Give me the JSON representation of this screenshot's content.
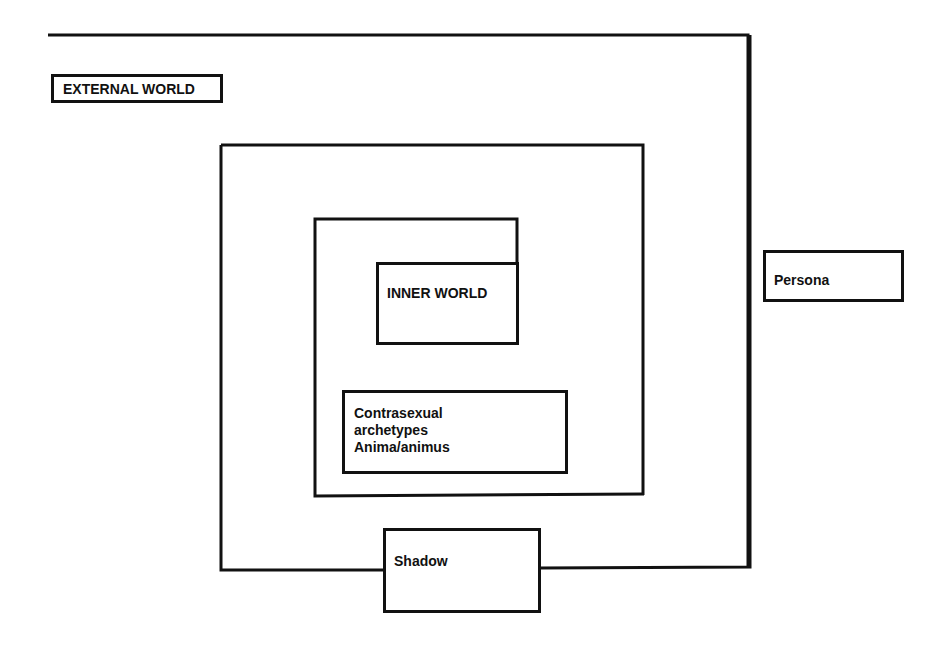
{
  "diagram": {
    "colors": {
      "stroke": "#111111",
      "background": "#ffffff"
    },
    "labels": {
      "external_world": "EXTERNAL WORLD",
      "persona": "Persona",
      "inner_world": "INNER WORLD",
      "contrasexual": "Contrasexual\narchetypes\nAnima/animus",
      "shadow": "Shadow"
    },
    "nodes": [
      {
        "id": "external_world",
        "label": "EXTERNAL WORLD"
      },
      {
        "id": "persona",
        "label": "Persona"
      },
      {
        "id": "inner_world",
        "label": "INNER WORLD"
      },
      {
        "id": "contrasexual",
        "label": "Contrasexual archetypes Anima/animus"
      },
      {
        "id": "shadow",
        "label": "Shadow"
      }
    ],
    "regions": [
      {
        "id": "outer_frame",
        "contains": [
          "external_world"
        ],
        "boundary_with": "persona"
      },
      {
        "id": "middle_box",
        "boundary_with": "shadow"
      },
      {
        "id": "inner_box",
        "contains": [
          "inner_world",
          "contrasexual"
        ]
      }
    ]
  }
}
